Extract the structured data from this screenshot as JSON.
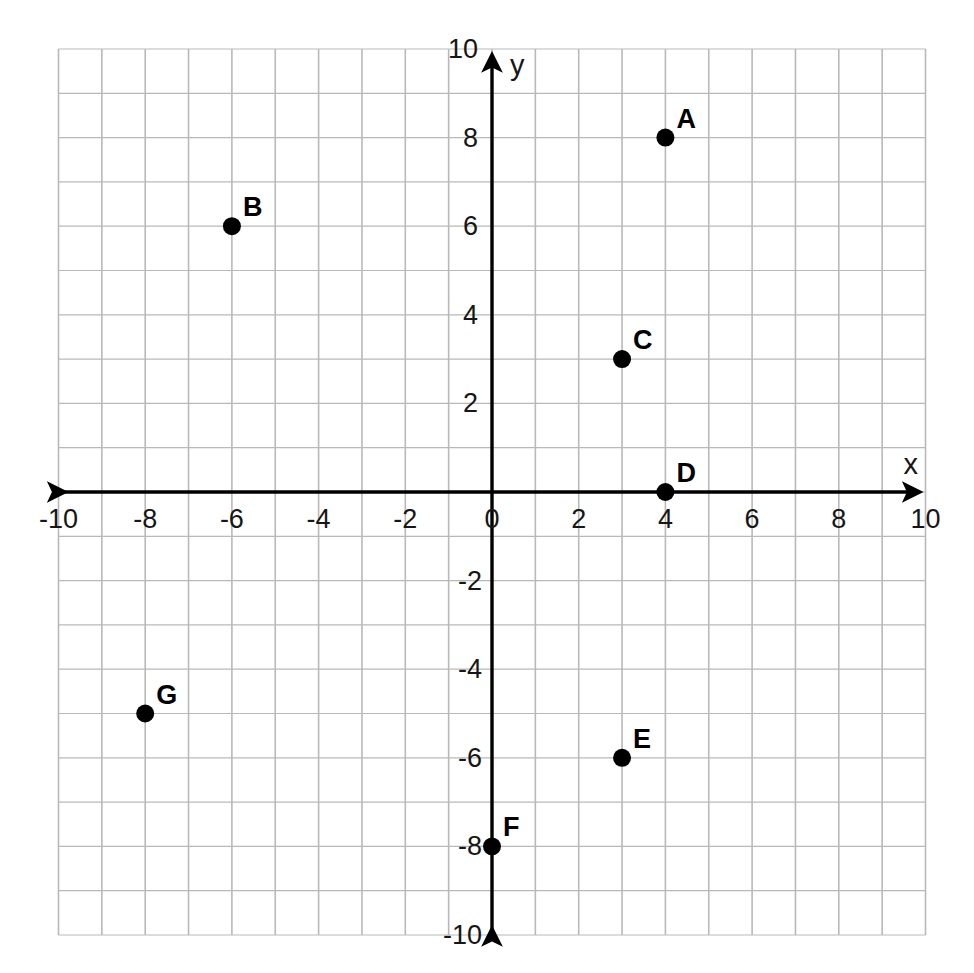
{
  "figure": {
    "kind": "coordinate-plane",
    "background_color": "#ffffff",
    "grid_color": "#b9b9b9",
    "axis_color": "#000000",
    "point_color": "#000000"
  },
  "axes": {
    "x_name": "x",
    "y_name": "y",
    "x_tick_labels": [
      "-10",
      "-8",
      "-6",
      "-4",
      "-2",
      "0",
      "2",
      "4",
      "6",
      "8",
      "10"
    ],
    "y_tick_labels_positive": [
      "10",
      "8",
      "6",
      "4",
      "2"
    ],
    "y_tick_label_origin": "0",
    "y_tick_labels_negative": [
      "-2",
      "-4",
      "-6",
      "-8",
      "-10"
    ]
  },
  "chart_data": {
    "type": "scatter",
    "title": "",
    "xlabel": "x",
    "ylabel": "y",
    "xlim": [
      -10,
      10
    ],
    "ylim": [
      -10,
      10
    ],
    "grid": true,
    "grid_step": 1,
    "tick_step": 2,
    "legend": "none",
    "xticks": [
      -10,
      -8,
      -6,
      -4,
      -2,
      0,
      2,
      4,
      6,
      8,
      10
    ],
    "yticks": [
      -10,
      -8,
      -6,
      -4,
      -2,
      0,
      2,
      4,
      6,
      8,
      10
    ],
    "points": [
      {
        "label": "A",
        "x": 4,
        "y": 8
      },
      {
        "label": "B",
        "x": -6,
        "y": 6
      },
      {
        "label": "C",
        "x": 3,
        "y": 3
      },
      {
        "label": "D",
        "x": 4,
        "y": 0
      },
      {
        "label": "E",
        "x": 3,
        "y": -6
      },
      {
        "label": "F",
        "x": 0,
        "y": -8
      },
      {
        "label": "G",
        "x": -8,
        "y": -5
      }
    ]
  }
}
